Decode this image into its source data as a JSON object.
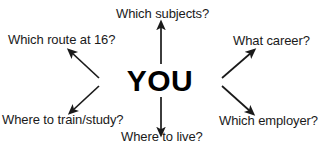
{
  "diagram": {
    "type": "radial-mind-map",
    "center": {
      "label": "YOU"
    },
    "background_color": "#ffffff",
    "text_color": "#1a1a1a",
    "center_text_color": "#000000",
    "arrow_color": "#1a1a1a",
    "branches": [
      {
        "id": "subjects",
        "label": "Which subjects?",
        "direction": "up",
        "arrow_icon": "arrow-up-icon"
      },
      {
        "id": "route",
        "label": "Which route at 16?",
        "direction": "up-left",
        "arrow_icon": "arrow-up-left-icon"
      },
      {
        "id": "career",
        "label": "What career?",
        "direction": "up-right",
        "arrow_icon": "arrow-up-right-icon"
      },
      {
        "id": "train",
        "label": "Where to train/study?",
        "direction": "down-left",
        "arrow_icon": "arrow-down-left-icon"
      },
      {
        "id": "employer",
        "label": "Which employer?",
        "direction": "down-right",
        "arrow_icon": "arrow-down-right-icon"
      },
      {
        "id": "live",
        "label": "Where to live?",
        "direction": "down",
        "arrow_icon": "arrow-down-icon"
      }
    ]
  }
}
